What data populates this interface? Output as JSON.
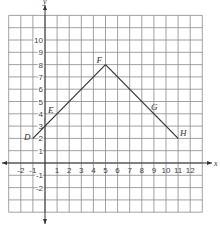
{
  "diagram": {
    "type": "coordinate-grid",
    "axes": {
      "x_label": "x",
      "y_label": "y",
      "x_range": [
        -3,
        13
      ],
      "y_range": [
        -4,
        12
      ],
      "x_tick_labels": [
        "-2",
        "-1",
        "1",
        "2",
        "3",
        "4",
        "5",
        "6",
        "7",
        "8",
        "9",
        "10",
        "11",
        "12"
      ],
      "x_tick_values": [
        -2,
        -1,
        1,
        2,
        3,
        4,
        5,
        6,
        7,
        8,
        9,
        10,
        11,
        12
      ],
      "y_tick_labels": [
        "-2",
        "-1",
        "1",
        "2",
        "3",
        "4",
        "5",
        "6",
        "7",
        "8",
        "9",
        "10"
      ],
      "y_tick_values": [
        -2,
        -1,
        1,
        2,
        3,
        4,
        5,
        6,
        7,
        8,
        9,
        10
      ]
    },
    "points": [
      {
        "label": "D",
        "x": -1,
        "y": 2
      },
      {
        "label": "E",
        "x": 1,
        "y": 4
      },
      {
        "label": "F",
        "x": 5,
        "y": 8
      },
      {
        "label": "G",
        "x": 9,
        "y": 4
      },
      {
        "label": "H",
        "x": 11,
        "y": 2
      }
    ],
    "segments": [
      {
        "from": "D",
        "to": "F"
      },
      {
        "from": "F",
        "to": "H"
      }
    ],
    "colors": {
      "grid": "#8a8a8a",
      "axis": "#333333",
      "line": "#333333",
      "background": "#ffffff"
    }
  }
}
